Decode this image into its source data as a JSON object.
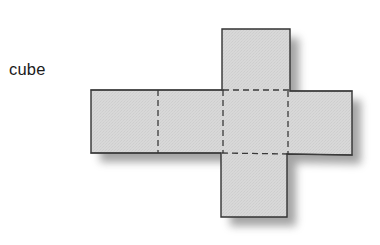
{
  "figure": {
    "label": "cube",
    "caption_text": "cube",
    "background_color": "#ffffff",
    "label_color": "#1b1b1b"
  },
  "diagram": {
    "name": "cube-net",
    "kind": "net-of-solid",
    "solid": "cube",
    "face_count": 6,
    "arrangement": "cross",
    "fill_color": "#d6d6d6",
    "stroke_color": "#333333",
    "dashed_stroke_color": "#3a3a3a",
    "shadow_color": "#9a9a9a",
    "stroke_width": 1.4,
    "dash_pattern": "6 4",
    "faces": [
      {
        "name": "top-face",
        "x": 222,
        "y": 29,
        "width": 68,
        "height": 61
      },
      {
        "name": "left-far-face",
        "x": 91,
        "y": 90,
        "width": 67,
        "height": 63
      },
      {
        "name": "left-near-face",
        "x": 158,
        "y": 90,
        "width": 65,
        "height": 63
      },
      {
        "name": "center-face",
        "x": 223,
        "y": 90,
        "width": 65,
        "height": 63
      },
      {
        "name": "right-face",
        "x": 288,
        "y": 91,
        "width": 64,
        "height": 64
      },
      {
        "name": "bottom-face",
        "x": 221,
        "y": 153,
        "width": 66,
        "height": 64
      }
    ],
    "dashed_edges": [
      {
        "name": "fold-left-near-vertical",
        "x1": 158,
        "y1": 90,
        "x2": 158,
        "y2": 153
      },
      {
        "name": "fold-center-left-vertical",
        "x1": 223,
        "y1": 90,
        "x2": 223,
        "y2": 153
      },
      {
        "name": "fold-center-right-vertical",
        "x1": 288,
        "y1": 91,
        "x2": 288,
        "y2": 154
      },
      {
        "name": "fold-center-top-horizontal",
        "x1": 223,
        "y1": 90,
        "x2": 288,
        "y2": 90
      },
      {
        "name": "fold-center-bottom-horizontal",
        "x1": 223,
        "y1": 153,
        "x2": 288,
        "y2": 154
      }
    ]
  }
}
